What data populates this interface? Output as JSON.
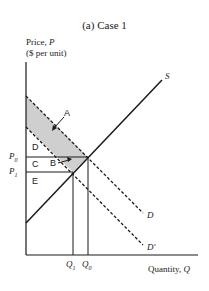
{
  "title": "(a) Case 1",
  "axes": {
    "y_label_line1": "Price, ",
    "y_label_var": "P",
    "y_label_line2": "($ per unit)",
    "x_label": "Quantity, ",
    "x_label_var": "Q"
  },
  "price_ticks": [
    {
      "label": "P",
      "sub": "0"
    },
    {
      "label": "P",
      "sub": "1"
    }
  ],
  "quantity_ticks": [
    {
      "label": "Q",
      "sub": "1"
    },
    {
      "label": "Q",
      "sub": "0"
    }
  ],
  "curves": {
    "supply": "S",
    "demand": "D",
    "demand_shifted": "D'"
  },
  "areas": {
    "a": "A",
    "b": "B",
    "c": "C",
    "d": "D",
    "e": "E"
  },
  "colors": {
    "line": "#1a1a1a",
    "shade": "#cfcfcf"
  }
}
